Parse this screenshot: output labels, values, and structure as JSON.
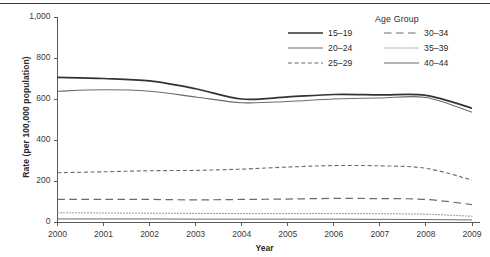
{
  "chart_data": {
    "type": "line",
    "title": "",
    "xlabel": "Year",
    "ylabel": "Rate (per 100,000 population)",
    "x": [
      2000,
      2001,
      2002,
      2003,
      2004,
      2005,
      2006,
      2007,
      2008,
      2009
    ],
    "xtick_labels": [
      "2000",
      "2001",
      "2002",
      "2003",
      "2004",
      "2005",
      "2006",
      "2007",
      "2008",
      "2009"
    ],
    "ytick_labels": [
      "0",
      "200",
      "400",
      "600",
      "800",
      "1,000"
    ],
    "ytick_values": [
      0,
      200,
      400,
      600,
      800,
      1000
    ],
    "ylim": [
      0,
      1000
    ],
    "xlim": [
      2000,
      2009
    ],
    "grid": false,
    "legend_position": "top-right",
    "legend_title": "Age Group",
    "series": [
      {
        "name": "15–19",
        "style": "solid",
        "width": 1.7,
        "color": "#333333",
        "values": [
          705,
          700,
          688,
          650,
          600,
          610,
          622,
          620,
          618,
          555
        ]
      },
      {
        "name": "20–24",
        "style": "solid",
        "width": 1.1,
        "color": "#6b6b6b",
        "values": [
          638,
          645,
          638,
          610,
          582,
          588,
          600,
          605,
          607,
          535
        ]
      },
      {
        "name": "25–29",
        "style": "dashed",
        "width": 1.1,
        "color": "#6b6b6b",
        "values": [
          240,
          245,
          250,
          252,
          258,
          268,
          275,
          274,
          262,
          205
        ]
      },
      {
        "name": "30–34",
        "style": "longdash",
        "width": 1.2,
        "color": "#6b6b6b",
        "values": [
          110,
          110,
          110,
          108,
          110,
          112,
          115,
          114,
          110,
          85
        ]
      },
      {
        "name": "35–39",
        "style": "dotted",
        "width": 1.0,
        "color": "#8a8a8a",
        "values": [
          45,
          44,
          43,
          42,
          41,
          41,
          41,
          40,
          38,
          28
        ]
      },
      {
        "name": "40–44",
        "style": "solid",
        "width": 1.0,
        "color": "#6b6b6b",
        "values": [
          15,
          15,
          15,
          14,
          14,
          14,
          14,
          13,
          12,
          10
        ]
      }
    ]
  },
  "legend": {
    "title": "Age Group",
    "entries": [
      {
        "label": "15–19"
      },
      {
        "label": "30–34"
      },
      {
        "label": "20–24"
      },
      {
        "label": "35–39"
      },
      {
        "label": "25–29"
      },
      {
        "label": "40–44"
      }
    ]
  },
  "axes": {
    "y_title": "Rate (per 100,000 population)",
    "x_title": "Year"
  }
}
